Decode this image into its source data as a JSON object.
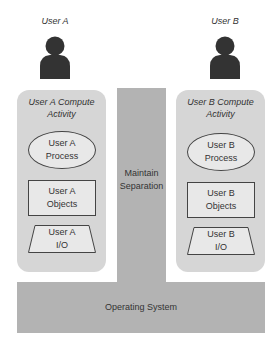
{
  "users": [
    {
      "id": "a",
      "label": "User A",
      "panel_title": "User A Compute\nActivity",
      "process": "User A\nProcess",
      "objects": "User A\nObjects",
      "io": "User A\nI/O"
    },
    {
      "id": "b",
      "label": "User B",
      "panel_title": "User B Compute\nActivity",
      "process": "User B\nProcess",
      "objects": "User B\nObjects",
      "io": "User B\nI/O"
    }
  ],
  "separator": {
    "label": "Maintain\nSeparation"
  },
  "os": {
    "label": "Operating System"
  },
  "icons": {
    "user": "person-silhouette-icon"
  },
  "colors": {
    "panel": "#d6d6d6",
    "os": "#b3b3b3",
    "shape_fill": "#e8e8e8",
    "outline": "#444444",
    "person": "#333333"
  }
}
